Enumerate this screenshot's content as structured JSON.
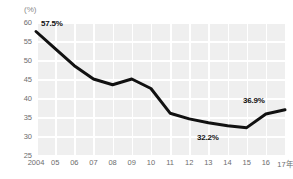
{
  "axis": {
    "unit_label": "(%)",
    "y_ticks": [
      "60",
      "55",
      "50",
      "45",
      "40",
      "35",
      "30",
      "25"
    ],
    "x_ticks": [
      "2004",
      "05",
      "06",
      "07",
      "08",
      "09",
      "10",
      "11",
      "12",
      "13",
      "14",
      "15",
      "16",
      "17年"
    ]
  },
  "callouts": [
    {
      "name": "callout-2004",
      "text": "57.5%"
    },
    {
      "name": "callout-2015",
      "text": "32.2%"
    },
    {
      "name": "callout-2017",
      "text": "36.9%"
    }
  ],
  "colors": {
    "plot_background": "#efefef",
    "gridline": "#ffffff",
    "line": "#111111",
    "tick_text": "#6d6d6d",
    "callout_text": "#111111"
  },
  "chart_data": {
    "type": "line",
    "title": "",
    "subtitle": "",
    "xlabel": "",
    "ylabel": "(%)",
    "categories": [
      "2004",
      "05",
      "06",
      "07",
      "08",
      "09",
      "10",
      "11",
      "12",
      "13",
      "14",
      "15",
      "16",
      "17年"
    ],
    "values": [
      57.5,
      53.0,
      48.5,
      45.0,
      43.5,
      45.0,
      42.5,
      36.0,
      34.5,
      33.5,
      32.7,
      32.2,
      35.8,
      36.9
    ],
    "ylim": [
      25,
      60
    ],
    "ytick_step": 5,
    "grid": true,
    "legend": "none",
    "annotations": [
      {
        "category": "2004",
        "value": 57.5,
        "text": "57.5%"
      },
      {
        "category": "15",
        "value": 32.2,
        "text": "32.2%"
      },
      {
        "category": "17年",
        "value": 36.9,
        "text": "36.9%"
      }
    ]
  }
}
